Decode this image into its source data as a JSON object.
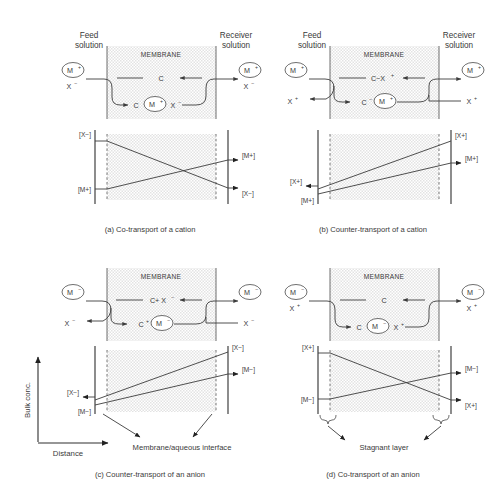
{
  "figure": {
    "title_caption": "Schematic representation of carrier-mediated transport across a liquid membrane",
    "axis": {
      "y_label": "Bulk conc.",
      "x_label": "Distance"
    },
    "annotations": {
      "interface": "Membrane/aqueous interface",
      "stagnant": "Stagnant layer"
    }
  },
  "panels": [
    {
      "id": "a",
      "caption": "(a) Co-transport of a cation",
      "feed_label": "Feed\nsolution",
      "feed_line1": "Feed",
      "feed_line2": "solution",
      "receiver_line1": "Receiver",
      "receiver_line2": "solution",
      "membrane_label": "MEMBRANE",
      "feed_ion_circle": "M",
      "feed_ion_charge": "+",
      "feed_ion_counter": "X",
      "feed_ion_counter_charge": "−",
      "receiver_ion_circle": "M",
      "receiver_ion_charge": "+",
      "receiver_ion_counter": "X",
      "receiver_ion_counter_charge": "−",
      "carrier_top": "C",
      "carrier_top_charge": "",
      "complex_prefix": "C",
      "complex_prefix_charge": "",
      "complex_circle": "M",
      "complex_circle_charge": "+",
      "complex_suffix": "X",
      "complex_suffix_charge": "−",
      "graph": {
        "type": "line",
        "description": "Crossing profiles: X minus decreases left to right, M plus increases left to right",
        "left_top_label": "[X−]",
        "left_bottom_label": "[M+]",
        "right_top_label": "[M+]",
        "right_bottom_label": "[X−]",
        "series": [
          {
            "name": "[X-]",
            "x": [
              0,
              1
            ],
            "y": [
              0.92,
              0.08
            ],
            "arrow": "right"
          },
          {
            "name": "[M+]",
            "x": [
              0,
              1
            ],
            "y": [
              0.1,
              0.72
            ],
            "arrow": "right"
          }
        ]
      }
    },
    {
      "id": "b",
      "caption": "(b) Counter-transport of a cation",
      "feed_line1": "Feed",
      "feed_line2": "solution",
      "receiver_line1": "Receiver",
      "receiver_line2": "solution",
      "membrane_label": "MEMBRANE",
      "feed_ion_circle": "M",
      "feed_ion_charge": "+",
      "feed_ion_counter": "X",
      "feed_ion_counter_charge": "+",
      "receiver_ion_circle": "M",
      "receiver_ion_charge": "+",
      "receiver_ion_counter": "X",
      "receiver_ion_counter_charge": "+",
      "carrier_top": "C−X",
      "carrier_top_charge": "+",
      "complex_prefix": "C",
      "complex_prefix_charge": "−",
      "complex_circle": "M",
      "complex_circle_charge": "+",
      "complex_suffix": "",
      "complex_suffix_charge": "",
      "graph": {
        "type": "line",
        "description": "Parallel rising profiles; X plus flows leftwards, M plus flows rightwards",
        "left_top_label": "[X+]",
        "left_bottom_label": "[M+]",
        "right_top_label": "[X+]",
        "right_bottom_label": "[M+]",
        "series": [
          {
            "name": "[X+]",
            "x": [
              0,
              1
            ],
            "y": [
              0.18,
              0.88
            ],
            "arrow": "left"
          },
          {
            "name": "[M+]",
            "x": [
              0,
              1
            ],
            "y": [
              0.08,
              0.7
            ],
            "arrow": "right"
          }
        ]
      }
    },
    {
      "id": "c",
      "caption": "(c) Counter-transport of an anion",
      "feed_line1": "",
      "feed_line2": "",
      "receiver_line1": "",
      "receiver_line2": "",
      "membrane_label": "MEMBRANE",
      "feed_ion_circle": "M",
      "feed_ion_charge": "−",
      "feed_ion_counter": "X",
      "feed_ion_counter_charge": "−",
      "receiver_ion_circle": "M",
      "receiver_ion_charge": "−",
      "receiver_ion_counter": "X",
      "receiver_ion_counter_charge": "−",
      "carrier_top": "C+ X",
      "carrier_top_charge": "−",
      "complex_prefix": "C",
      "complex_prefix_charge": "+",
      "complex_circle": "M",
      "complex_circle_charge": "−",
      "complex_suffix": "",
      "complex_suffix_charge": "",
      "graph": {
        "type": "line",
        "description": "Parallel rising profiles; X minus flows leftwards, M minus flows rightwards",
        "left_top_label": "[X−]",
        "left_bottom_label": "[M−]",
        "right_top_label": "[X−]",
        "right_bottom_label": "[M−]",
        "series": [
          {
            "name": "[X-]",
            "x": [
              0,
              1
            ],
            "y": [
              0.18,
              0.88
            ],
            "arrow": "left"
          },
          {
            "name": "[M-]",
            "x": [
              0,
              1
            ],
            "y": [
              0.08,
              0.7
            ],
            "arrow": "right"
          }
        ]
      }
    },
    {
      "id": "d",
      "caption": "(d) Co-transport of an anion",
      "feed_line1": "",
      "feed_line2": "",
      "receiver_line1": "",
      "receiver_line2": "",
      "membrane_label": "MEMBRANE",
      "feed_ion_circle": "M",
      "feed_ion_charge": "−",
      "feed_ion_counter": "X",
      "feed_ion_counter_charge": "+",
      "receiver_ion_circle": "M",
      "receiver_ion_charge": "−",
      "receiver_ion_counter": "X",
      "receiver_ion_counter_charge": "+",
      "carrier_top": "C",
      "carrier_top_charge": "",
      "complex_prefix": "C",
      "complex_prefix_charge": "",
      "complex_circle": "M",
      "complex_circle_charge": "−",
      "complex_suffix": "X",
      "complex_suffix_charge": "+",
      "graph": {
        "type": "line",
        "description": "Crossing profiles: X plus decreases left to right, M minus increases left to right",
        "left_top_label": "[X+]",
        "left_bottom_label": "[M−]",
        "right_top_label": "[M−]",
        "right_bottom_label": "[X+]",
        "series": [
          {
            "name": "[X+]",
            "x": [
              0,
              1
            ],
            "y": [
              0.92,
              0.08
            ],
            "arrow": "right"
          },
          {
            "name": "[M-]",
            "x": [
              0,
              1
            ],
            "y": [
              0.1,
              0.72
            ],
            "arrow": "right"
          }
        ]
      }
    }
  ]
}
